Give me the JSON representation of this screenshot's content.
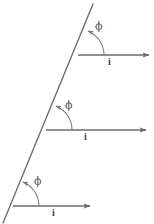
{
  "figure": {
    "background_color": "#ffffff",
    "line_color": "#6b6b6b",
    "arc_color": "#7a7a7a",
    "text_color": "#4a4a4a",
    "width": 154,
    "height": 224
  },
  "inclined_line": {
    "name": "inclined-line",
    "x1": 93,
    "y1": 4,
    "x2": 3,
    "y2": 223
  },
  "groups": [
    {
      "id": "top",
      "vertex": {
        "x": 78,
        "y": 55
      },
      "angle_label": "ϕ",
      "angle_label_pos": {
        "x": 95,
        "y": 21
      },
      "vector_label": "i",
      "vector_label_pos": {
        "x": 108,
        "y": 57
      },
      "arrow": {
        "x1": 78,
        "y1": 55,
        "x2": 151,
        "y2": 55
      },
      "arc_radius": 26
    },
    {
      "id": "middle",
      "vertex": {
        "x": 46,
        "y": 130
      },
      "angle_label": "ϕ",
      "angle_label_pos": {
        "x": 65,
        "y": 100
      },
      "vector_label": "i",
      "vector_label_pos": {
        "x": 84,
        "y": 132
      },
      "arrow": {
        "x1": 46,
        "y1": 130,
        "x2": 148,
        "y2": 130
      },
      "arc_radius": 26
    },
    {
      "id": "bottom",
      "vertex": {
        "x": 13,
        "y": 206
      },
      "angle_label": "ϕ",
      "angle_label_pos": {
        "x": 34,
        "y": 176
      },
      "vector_label": "i",
      "vector_label_pos": {
        "x": 52,
        "y": 208
      },
      "arrow": {
        "x1": 13,
        "y1": 206,
        "x2": 92,
        "y2": 206
      },
      "arc_radius": 26
    }
  ]
}
